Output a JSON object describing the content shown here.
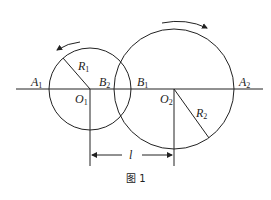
{
  "figure": {
    "caption": "图 1",
    "labels": {
      "A1": {
        "base": "A",
        "sub": "1"
      },
      "B2": {
        "base": "B",
        "sub": "2"
      },
      "B1": {
        "base": "B",
        "sub": "1"
      },
      "A2": {
        "base": "A",
        "sub": "2"
      },
      "O1": {
        "base": "O",
        "sub": "1"
      },
      "O2": {
        "base": "O",
        "sub": "2"
      },
      "R1": {
        "base": "R",
        "sub": "1"
      },
      "R2": {
        "base": "R",
        "sub": "2"
      },
      "l": "l"
    },
    "circles": [
      {
        "name": "circle-1",
        "cx": 90,
        "cy": 89,
        "r": 41,
        "rotation": "counterclockwise"
      },
      {
        "name": "circle-2",
        "cx": 174,
        "cy": 89,
        "r": 60,
        "rotation": "clockwise"
      }
    ],
    "stroke_color": "#222222"
  }
}
